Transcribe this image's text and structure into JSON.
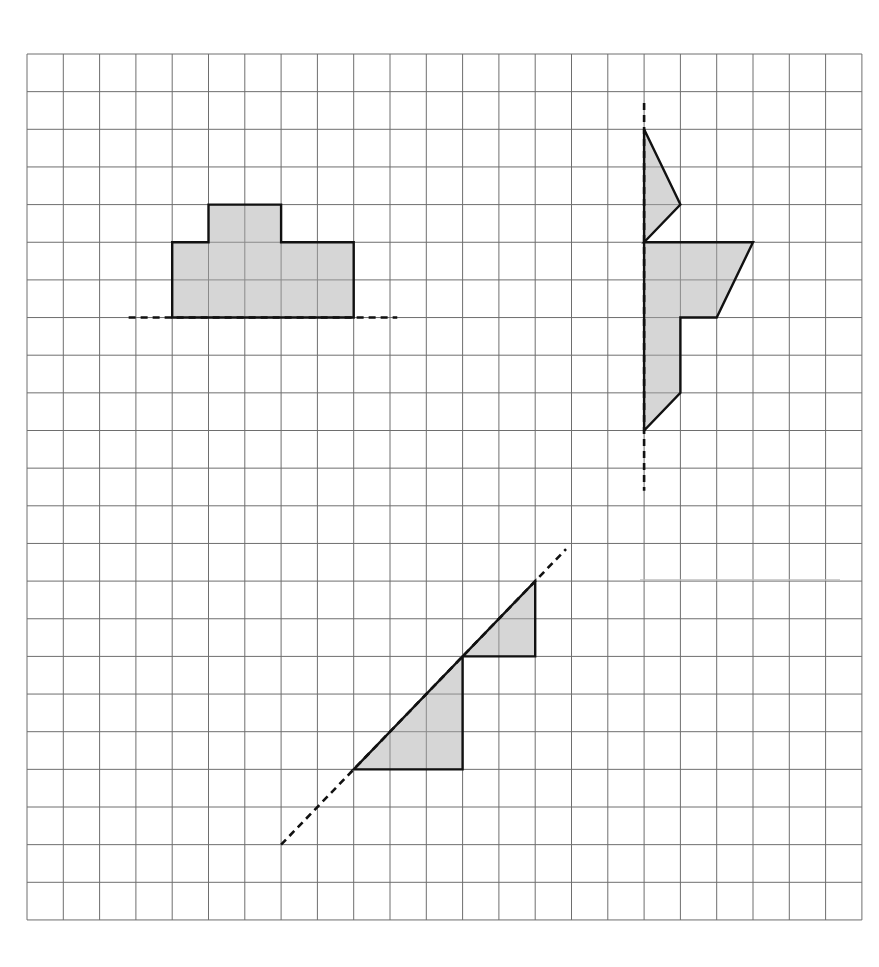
{
  "diagram": {
    "type": "grid-reflection-exercise",
    "grid": {
      "cols": 23,
      "rows": 23,
      "origin_px": [
        27,
        54
      ],
      "cell_w_px": 36.3,
      "cell_h_px": 37.65,
      "line_color": "#6e6e6e"
    },
    "colors": {
      "fill": "#d6d6d6",
      "outline": "#111111",
      "background": "#ffffff"
    },
    "shapes": [
      {
        "id": "shape-top-left",
        "points": [
          [
            4,
            7
          ],
          [
            4,
            5
          ],
          [
            5,
            5
          ],
          [
            5,
            4
          ],
          [
            7,
            4
          ],
          [
            7,
            5
          ],
          [
            9,
            5
          ],
          [
            9,
            7
          ]
        ],
        "mirror_line": {
          "from": [
            2.8,
            7
          ],
          "to": [
            10.2,
            7
          ],
          "orientation": "horizontal"
        }
      },
      {
        "id": "shape-top-right",
        "points": [
          [
            17,
            2
          ],
          [
            18,
            4
          ],
          [
            17,
            5
          ],
          [
            20,
            5
          ],
          [
            19,
            7
          ],
          [
            18,
            7
          ],
          [
            18,
            9
          ],
          [
            17,
            10
          ]
        ],
        "mirror_line": {
          "from": [
            17,
            1.3
          ],
          "to": [
            17,
            11.6
          ],
          "orientation": "vertical"
        }
      },
      {
        "id": "shape-bottom",
        "points": [
          [
            9,
            19
          ],
          [
            12,
            19
          ],
          [
            12,
            16
          ],
          [
            14,
            16
          ],
          [
            14,
            14
          ]
        ],
        "mirror_line": {
          "from": [
            7,
            21
          ],
          "to": [
            14.85,
            13.15
          ],
          "orientation": "diagonal"
        }
      }
    ]
  }
}
